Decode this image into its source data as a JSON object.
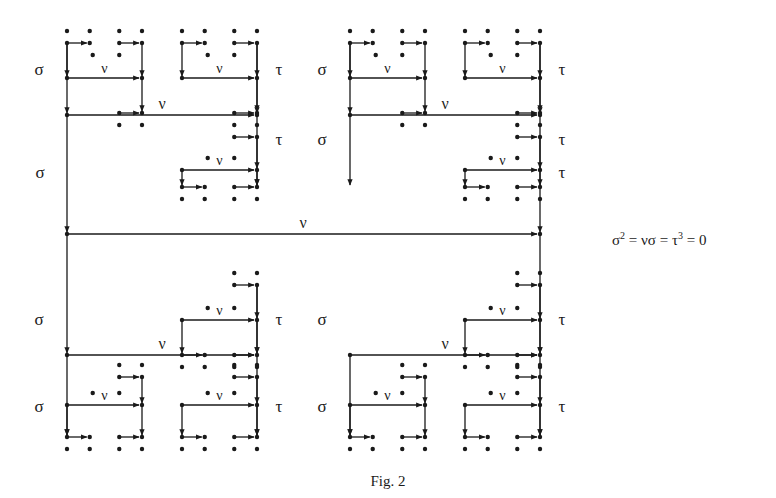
{
  "figure": {
    "caption": "Fig. 2",
    "relation": {
      "parts": [
        "σ",
        "2",
        " = νσ = τ",
        "3",
        " = 0"
      ],
      "full_text": "σ² = νσ = τ³ = 0"
    },
    "labels": {
      "sigma": "σ",
      "nu": "ν",
      "tau": "τ"
    },
    "structure": {
      "description": "Recursive self-similar diagram of dots connected by σ (vertical, left), ν (horizontal), τ (vertical, right) arrows",
      "top_level_blocks": 4,
      "recursion_depth": 3
    },
    "colors": {
      "ink": "#1a1a1a",
      "background": "#ffffff"
    }
  }
}
